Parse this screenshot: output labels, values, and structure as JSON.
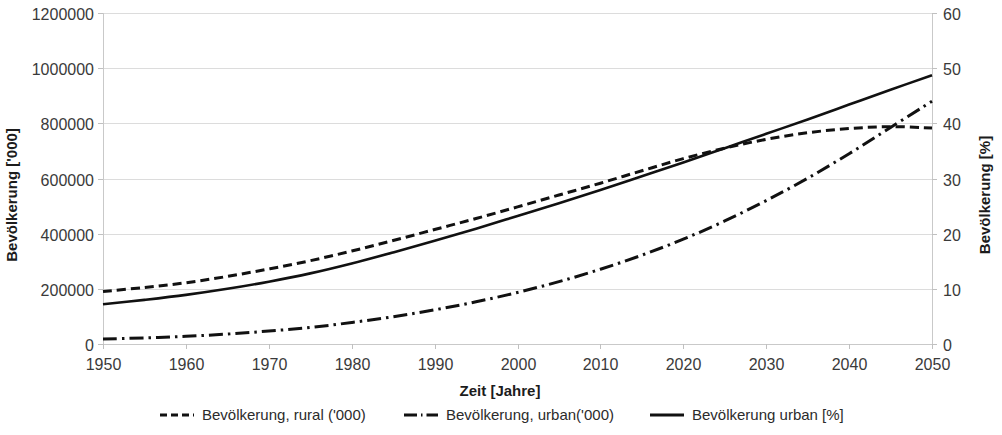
{
  "chart_data": {
    "type": "line",
    "title": "",
    "xlabel": "Zeit [Jahre]",
    "ylabel": "Bevölkerung ['000]",
    "y2label": "Bevölkerung [%]",
    "xlim": [
      1950,
      2050
    ],
    "ylim": [
      0,
      1200000
    ],
    "y2lim": [
      0,
      60
    ],
    "grid": true,
    "legend_position": "bottom",
    "xticks": [
      1950,
      1960,
      1970,
      1980,
      1990,
      2000,
      2010,
      2020,
      2030,
      2040,
      2050
    ],
    "xtick_labels": [
      "1950",
      "1960",
      "1970",
      "1980",
      "1990",
      "2000",
      "2010",
      "2020",
      "2030",
      "2040",
      "2050"
    ],
    "yticks": [
      0,
      200000,
      400000,
      600000,
      800000,
      1000000,
      1200000
    ],
    "ytick_labels": [
      "0",
      "200000",
      "400000",
      "600000",
      "800000",
      "1000000",
      "1200000"
    ],
    "y2ticks": [
      0,
      10,
      20,
      30,
      40,
      50,
      60
    ],
    "y2tick_labels": [
      "0",
      "10",
      "20",
      "30",
      "40",
      "50",
      "60"
    ],
    "x": [
      1950,
      1955,
      1960,
      1965,
      1970,
      1975,
      1980,
      1985,
      1990,
      1995,
      2000,
      2005,
      2010,
      2015,
      2020,
      2025,
      2030,
      2035,
      2040,
      2045,
      2050
    ],
    "series": [
      {
        "name": "Bevölkerung, rural ('000)",
        "axis": "left",
        "dash": "dashed",
        "values": [
          190000,
          205000,
          222000,
          245000,
          272000,
          302000,
          337000,
          375000,
          415000,
          455000,
          497000,
          540000,
          583000,
          628000,
          672000,
          710000,
          742000,
          766000,
          781000,
          788000,
          783000
        ]
      },
      {
        "name": "Bevölkerung, urban('000)",
        "axis": "left",
        "dash": "dashdot",
        "values": [
          18000,
          22000,
          28000,
          36000,
          47000,
          60000,
          78000,
          99000,
          124000,
          153000,
          187000,
          226000,
          271000,
          322000,
          380000,
          446000,
          520000,
          601000,
          690000,
          785000,
          880000
        ]
      },
      {
        "name": "Bevölkerung urban [%]",
        "axis": "right",
        "dash": "solid",
        "values": [
          7.2,
          8.0,
          8.9,
          10.0,
          11.3,
          12.8,
          14.6,
          16.6,
          18.7,
          20.9,
          23.2,
          25.5,
          27.9,
          30.4,
          32.9,
          35.5,
          38.1,
          40.7,
          43.4,
          46.1,
          48.7
        ]
      }
    ]
  },
  "legend": {
    "items": [
      {
        "label": "Bevölkerung, rural ('000)",
        "dash": "dashed"
      },
      {
        "label": "Bevölkerung, urban('000)",
        "dash": "dashdot"
      },
      {
        "label": "Bevölkerung urban [%]",
        "dash": "solid"
      }
    ]
  },
  "colors": {
    "series": "#111111",
    "grid": "#dcdcdc",
    "axis": "#c9c9c9",
    "text": "#2b2b2b",
    "background": "#ffffff"
  }
}
